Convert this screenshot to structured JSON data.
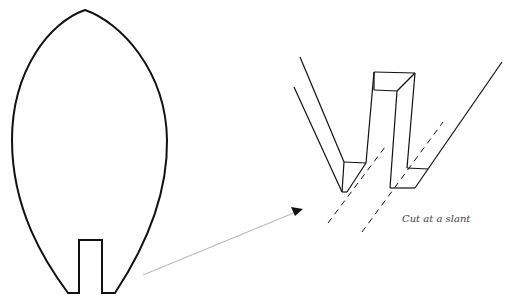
{
  "diagram": {
    "type": "instructional-illustration",
    "caption": "Cut at a slant",
    "colors": {
      "stroke": "#111111",
      "arrow": "#bbbbbb",
      "arrowhead": "#111111",
      "caption": "#444444",
      "background": "#ffffff"
    },
    "elements": [
      {
        "id": "leaf-outline",
        "label": "pointed oval leaf shape with rectangular slot at bottom"
      },
      {
        "id": "pointer-arrow",
        "label": "arrow from leaf base to enlarged detail"
      },
      {
        "id": "detail-3d",
        "label": "3D enlarged view of slotted base with tab"
      },
      {
        "id": "cut-lines",
        "label": "two dashed slanted cut guide lines"
      }
    ]
  }
}
